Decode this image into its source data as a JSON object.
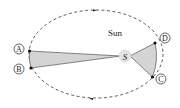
{
  "diagram": {
    "sun_label": "Sun",
    "focus_label": "S",
    "points": [
      {
        "id": "A",
        "label": "A"
      },
      {
        "id": "B",
        "label": "B"
      },
      {
        "id": "C",
        "label": "C"
      },
      {
        "id": "D",
        "label": "D"
      }
    ],
    "colors": {
      "orbit": "#333333",
      "sector_fill": "#d4d4d4",
      "sector_stroke": "#555555",
      "sun_fill": "#e4e4e4",
      "dot": "#111111"
    }
  }
}
